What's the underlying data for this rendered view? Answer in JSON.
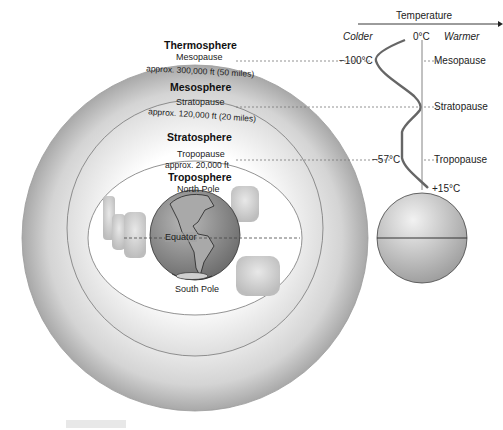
{
  "diagram": {
    "layers": {
      "thermosphere": "Thermosphere",
      "mesosphere": "Mesosphere",
      "stratosphere": "Stratosphere",
      "troposphere": "Troposphere"
    },
    "boundaries": {
      "mesopause": "Mesopause",
      "mesopause_alt": "approx. 300,000 ft (50 miles)",
      "stratopause": "Stratopause",
      "stratopause_alt": "approx. 120,000 ft (20 miles)",
      "tropopause": "Tropopause",
      "tropopause_alt": "approx. 20,000 ft"
    },
    "earth": {
      "north_pole": "North Pole",
      "south_pole": "South Pole",
      "equator": "Equator"
    },
    "temperature_axis": {
      "title": "Temperature",
      "colder": "Colder",
      "warmer": "Warmer",
      "zero": "0°C"
    },
    "temperature_profile": {
      "mesopause_temp": "−100°C",
      "tropopause_temp": "−57°C",
      "surface_temp": "+15°C",
      "labels": {
        "mesopause": "Mesopause",
        "stratopause": "Stratopause",
        "tropopause": "Tropopause"
      }
    },
    "colors": {
      "shell_outer": "#a9a9a9",
      "shell_inner": "#f4f4f4",
      "earth": "#8a8a8a",
      "line": "#555555"
    }
  }
}
